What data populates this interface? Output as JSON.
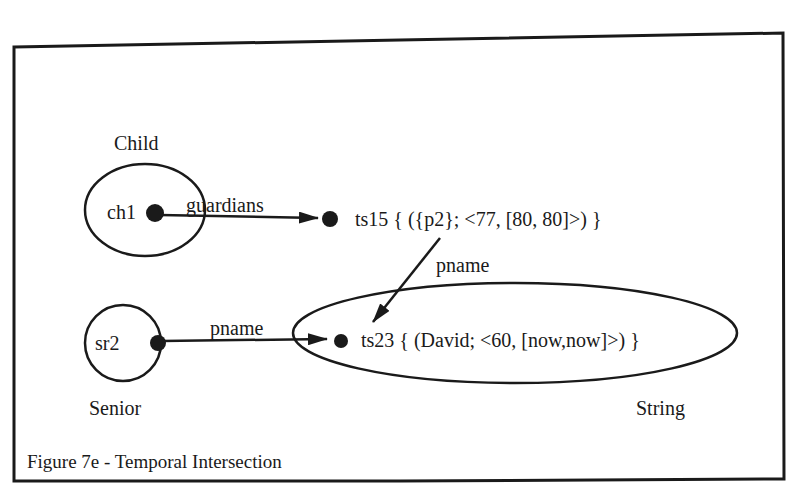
{
  "figure": {
    "caption": "Figure 7e - Temporal Intersection",
    "ink_color": "#1a1a1a",
    "background": "#ffffff"
  },
  "classes": {
    "child": "Child",
    "senior": "Senior",
    "string": "String"
  },
  "nodes": {
    "ch1": "ch1",
    "sr2": "sr2",
    "ts15": "ts15 { ({p2}; <77, [80, 80]>) }",
    "ts23": "ts23 { (David; <60, [now,now]>) }"
  },
  "edges": {
    "ch1_ts15": "guardians",
    "ts15_ts23": "pname",
    "sr2_ts23": "pname"
  }
}
